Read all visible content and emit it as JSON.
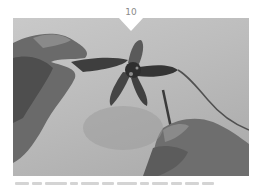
{
  "step": {
    "number": "10"
  },
  "photo": {
    "description": "Grayscale photo of two hands crocheting a star-shaped piece with a hook and yarn",
    "tone": "grayscale",
    "colors": {
      "background": "#c0c0c0",
      "hands": "#5a5a5a",
      "star": "#3a3a3a",
      "yarn": "#4a4a4a"
    }
  },
  "caption": {
    "text": "",
    "segments": [
      14,
      10,
      22,
      8,
      18,
      12,
      20,
      9,
      16,
      11,
      14,
      12
    ]
  }
}
